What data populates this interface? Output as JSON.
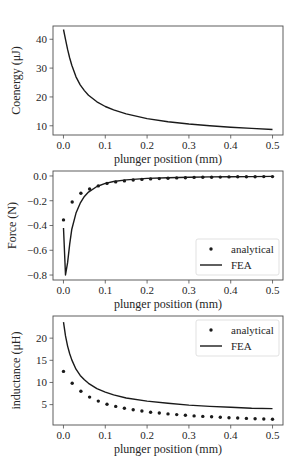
{
  "chart_data": [
    {
      "type": "line",
      "title": "",
      "xlabel": "plunger position (mm)",
      "ylabel": "Coenergy (μJ)",
      "xlim": [
        -0.025,
        0.525
      ],
      "ylim": [
        6.8,
        44.6
      ],
      "xticks": [
        0.0,
        0.1,
        0.2,
        0.3,
        0.4,
        0.5
      ],
      "xtick_labels": [
        "0.0",
        "0.1",
        "0.2",
        "0.3",
        "0.4",
        "0.5"
      ],
      "yticks": [
        10,
        20,
        30,
        40
      ],
      "ytick_labels": [
        "10",
        "20",
        "30",
        "40"
      ],
      "grid": false,
      "legend": null,
      "series": [
        {
          "name": "FEA",
          "style": "line",
          "x": [
            0.0,
            0.005,
            0.01,
            0.015,
            0.02,
            0.03,
            0.04,
            0.05,
            0.06,
            0.08,
            0.1,
            0.12,
            0.15,
            0.2,
            0.25,
            0.3,
            0.35,
            0.4,
            0.45,
            0.5
          ],
          "y": [
            43.4,
            40.0,
            36.5,
            33.5,
            31.0,
            27.0,
            24.2,
            22.2,
            20.6,
            18.3,
            16.7,
            15.5,
            14.1,
            12.5,
            11.4,
            10.6,
            10.0,
            9.5,
            9.1,
            8.7
          ]
        }
      ]
    },
    {
      "type": "line",
      "title": "",
      "xlabel": "plunger position (mm)",
      "ylabel": "Force (N)",
      "xlim": [
        -0.025,
        0.525
      ],
      "ylim": [
        -0.84,
        0.04
      ],
      "xticks": [
        0.0,
        0.1,
        0.2,
        0.3,
        0.4,
        0.5
      ],
      "xtick_labels": [
        "0.0",
        "0.1",
        "0.2",
        "0.3",
        "0.4",
        "0.5"
      ],
      "yticks": [
        0.0,
        -0.2,
        -0.4,
        -0.6,
        -0.8
      ],
      "ytick_labels": [
        "0.0",
        "−0.2",
        "−0.4",
        "−0.6",
        "−0.8"
      ],
      "grid": false,
      "legend": {
        "position": "lower right",
        "entries": [
          "analytical",
          "FEA"
        ]
      },
      "series": [
        {
          "name": "analytical",
          "style": "dots",
          "x": [
            0.0,
            0.0208,
            0.0417,
            0.0625,
            0.0833,
            0.1042,
            0.125,
            0.1458,
            0.1667,
            0.1875,
            0.2083,
            0.2292,
            0.25,
            0.2708,
            0.2917,
            0.3125,
            0.3333,
            0.3542,
            0.375,
            0.3958,
            0.4167,
            0.4375,
            0.4583,
            0.4792,
            0.5
          ],
          "y": [
            -0.355,
            -0.21,
            -0.14,
            -0.105,
            -0.08,
            -0.06,
            -0.048,
            -0.04,
            -0.033,
            -0.028,
            -0.024,
            -0.021,
            -0.018,
            -0.016,
            -0.014,
            -0.012,
            -0.011,
            -0.01,
            -0.009,
            -0.008,
            -0.007,
            -0.006,
            -0.006,
            -0.005,
            -0.005
          ]
        },
        {
          "name": "FEA",
          "style": "line",
          "x": [
            0.0,
            0.005,
            0.01,
            0.015,
            0.02,
            0.03,
            0.04,
            0.05,
            0.06,
            0.08,
            0.1,
            0.12,
            0.15,
            0.2,
            0.25,
            0.3,
            0.35,
            0.4,
            0.45,
            0.5
          ],
          "y": [
            -0.42,
            -0.8,
            -0.7,
            -0.55,
            -0.43,
            -0.3,
            -0.22,
            -0.165,
            -0.13,
            -0.085,
            -0.06,
            -0.045,
            -0.032,
            -0.02,
            -0.014,
            -0.01,
            -0.008,
            -0.006,
            -0.005,
            -0.004
          ]
        }
      ]
    },
    {
      "type": "line",
      "title": "",
      "xlabel": "plunger position (mm)",
      "ylabel": "inductance (μH)",
      "xlim": [
        -0.025,
        0.525
      ],
      "ylim": [
        0.4,
        25.0
      ],
      "xticks": [
        0.0,
        0.1,
        0.2,
        0.3,
        0.4,
        0.5
      ],
      "xtick_labels": [
        "0.0",
        "0.1",
        "0.2",
        "0.3",
        "0.4",
        "0.5"
      ],
      "yticks": [
        5,
        10,
        15,
        20
      ],
      "ytick_labels": [
        "5",
        "10",
        "15",
        "20"
      ],
      "grid": false,
      "legend": {
        "position": "upper right",
        "entries": [
          "analytical",
          "FEA"
        ]
      },
      "series": [
        {
          "name": "analytical",
          "style": "dots",
          "x": [
            0.0,
            0.0208,
            0.0417,
            0.0625,
            0.0833,
            0.1042,
            0.125,
            0.1458,
            0.1667,
            0.1875,
            0.2083,
            0.2292,
            0.25,
            0.2708,
            0.2917,
            0.3125,
            0.3333,
            0.3542,
            0.375,
            0.3958,
            0.4167,
            0.4375,
            0.4583,
            0.4792,
            0.5
          ],
          "y": [
            12.5,
            9.8,
            8.0,
            6.7,
            5.8,
            5.1,
            4.6,
            4.2,
            3.85,
            3.55,
            3.3,
            3.1,
            2.9,
            2.75,
            2.6,
            2.45,
            2.35,
            2.25,
            2.15,
            2.05,
            1.97,
            1.9,
            1.83,
            1.76,
            1.7
          ]
        },
        {
          "name": "FEA",
          "style": "line",
          "x": [
            0.0,
            0.005,
            0.01,
            0.015,
            0.02,
            0.03,
            0.04,
            0.05,
            0.06,
            0.08,
            0.1,
            0.12,
            0.15,
            0.2,
            0.25,
            0.3,
            0.35,
            0.4,
            0.45,
            0.5
          ],
          "y": [
            23.6,
            20.5,
            18.2,
            16.5,
            15.1,
            13.0,
            11.6,
            10.6,
            9.8,
            8.6,
            7.8,
            7.2,
            6.5,
            5.8,
            5.3,
            4.9,
            4.6,
            4.4,
            4.2,
            4.1
          ]
        }
      ]
    }
  ],
  "panels": [
    {
      "box": {
        "left": 53,
        "top": 26,
        "right": 283,
        "bottom": 135
      }
    },
    {
      "box": {
        "left": 53,
        "top": 171,
        "right": 283,
        "bottom": 280
      }
    },
    {
      "box": {
        "left": 53,
        "top": 316,
        "right": 283,
        "bottom": 425
      }
    }
  ],
  "style": {
    "line_color": "#1a1a1a",
    "axis_color": "#4d4d4d",
    "text_color": "#262626",
    "legend_border": "#d9d9d9"
  }
}
